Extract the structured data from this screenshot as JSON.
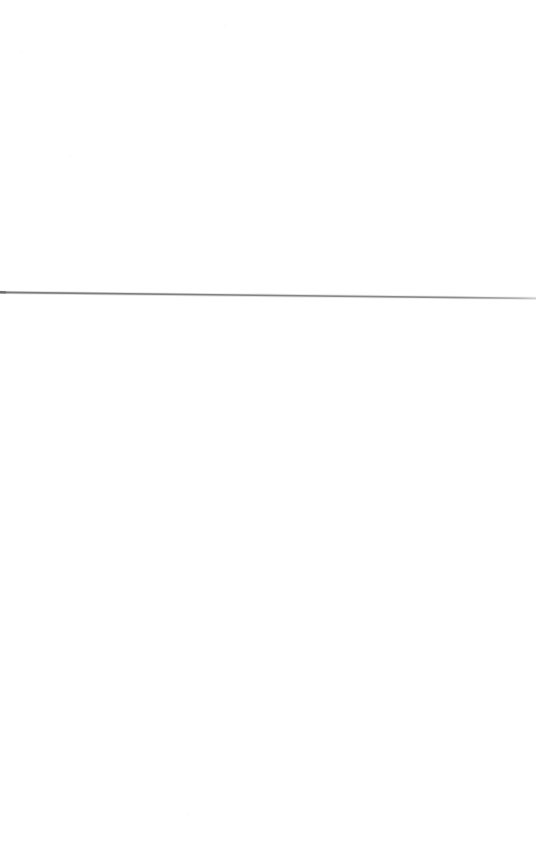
{
  "page": {
    "name": "blank-scanned-page",
    "width": 536,
    "height": 866,
    "background_color": "#ffffff",
    "content_description": "Blank white page containing a single thin, slightly sloping horizontal gray rule",
    "text_content": "",
    "alt_text": "A blank white page with one thin horizontal gray line across the upper-middle area"
  },
  "rule": {
    "name": "horizontal-rule",
    "orientation": "horizontal",
    "color_core": "#787878",
    "color_edge": "#c9c9c9",
    "thickness_px": 1.6,
    "x_start": 0,
    "y_start": 292,
    "x_end": 536,
    "y_end": 298,
    "slope_drop_px": 6,
    "left_cap_accent_color": "#6a6a6a",
    "right_cap_fade_color": "#d2d2d2"
  }
}
